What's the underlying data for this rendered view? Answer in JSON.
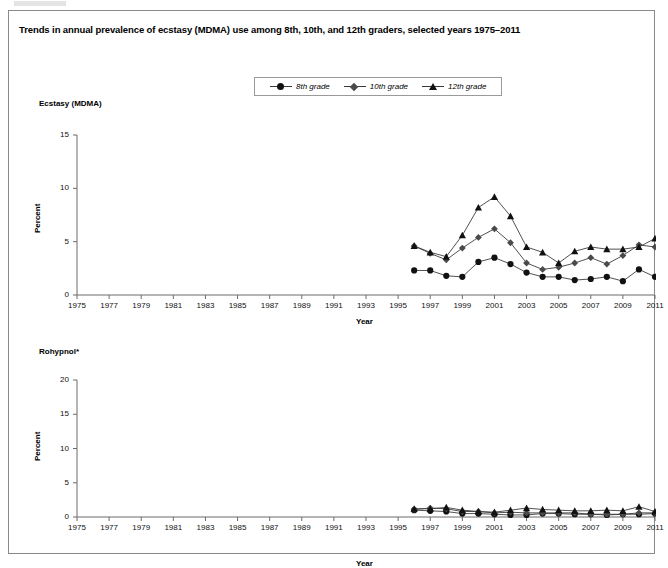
{
  "figure": {
    "title": "Trends in annual prevalence of ecstasy (MDMA) use among 8th, 10th, and 12th graders, selected years 1975–2011"
  },
  "legend": {
    "position": "top-center",
    "entries": [
      {
        "label": "8th grade",
        "marker": "circle",
        "color": "#111111"
      },
      {
        "label": "10th grade",
        "marker": "diamond",
        "color": "#4a4a4a"
      },
      {
        "label": "12th grade",
        "marker": "triangle",
        "color": "#111111"
      }
    ]
  },
  "panels": {
    "ecstasy": {
      "title": "Ecstasy (MDMA)",
      "ylabel": "Percent",
      "xlabel": "Year",
      "ytick_labels": [
        "15",
        "10",
        "5",
        "0"
      ],
      "xtick_labels": [
        "1975",
        "1977",
        "1979",
        "1981",
        "1983",
        "1985",
        "1987",
        "1989",
        "1991",
        "1993",
        "1995",
        "1997",
        "1999",
        "2001",
        "2003",
        "2005",
        "2007",
        "2009",
        "2011"
      ]
    },
    "rohypnol": {
      "title": "Rohypnol*",
      "ylabel": "Percent",
      "xlabel": "Year",
      "ytick_labels": [
        "20",
        "15",
        "10",
        "5",
        "0"
      ],
      "xtick_labels": [
        "1975",
        "1977",
        "1979",
        "1981",
        "1983",
        "1985",
        "1987",
        "1989",
        "1991",
        "1993",
        "1995",
        "1997",
        "1999",
        "2001",
        "2003",
        "2005",
        "2007",
        "2009",
        "2011"
      ]
    }
  },
  "chart_data": [
    {
      "type": "line",
      "id": "ecstasy-mdma",
      "title": "Ecstasy (MDMA)",
      "xlabel": "Year",
      "ylabel": "Percent",
      "xlim": [
        1975,
        2011
      ],
      "ylim": [
        0,
        15
      ],
      "yticks": [
        0,
        5,
        10,
        15
      ],
      "xticks": [
        1975,
        1977,
        1979,
        1981,
        1983,
        1985,
        1987,
        1989,
        1991,
        1993,
        1995,
        1997,
        1999,
        2001,
        2003,
        2005,
        2007,
        2009,
        2011
      ],
      "grid": false,
      "legend_position": "top-center",
      "x": [
        1996,
        1997,
        1998,
        1999,
        2000,
        2001,
        2002,
        2003,
        2004,
        2005,
        2006,
        2007,
        2008,
        2009,
        2010,
        2011
      ],
      "series": [
        {
          "name": "8th grade",
          "marker": "circle",
          "color": "#111111",
          "values": [
            2.3,
            2.3,
            1.8,
            1.7,
            3.1,
            3.5,
            2.9,
            2.1,
            1.7,
            1.7,
            1.4,
            1.5,
            1.7,
            1.3,
            2.4,
            1.7
          ]
        },
        {
          "name": "10th grade",
          "marker": "diamond",
          "color": "#4a4a4a",
          "values": [
            4.6,
            3.9,
            3.3,
            4.4,
            5.4,
            6.2,
            4.9,
            3.0,
            2.4,
            2.6,
            3.0,
            3.5,
            2.9,
            3.7,
            4.7,
            4.5
          ]
        },
        {
          "name": "12th grade",
          "marker": "triangle",
          "color": "#111111",
          "values": [
            4.6,
            4.0,
            3.6,
            5.6,
            8.2,
            9.2,
            7.4,
            4.5,
            4.0,
            3.0,
            4.1,
            4.5,
            4.3,
            4.3,
            4.5,
            5.3
          ]
        }
      ]
    },
    {
      "type": "line",
      "id": "rohypnol",
      "title": "Rohypnol*",
      "xlabel": "Year",
      "ylabel": "Percent",
      "xlim": [
        1975,
        2011
      ],
      "ylim": [
        0,
        20
      ],
      "yticks": [
        0,
        5,
        10,
        15,
        20
      ],
      "xticks": [
        1975,
        1977,
        1979,
        1981,
        1983,
        1985,
        1987,
        1989,
        1991,
        1993,
        1995,
        1997,
        1999,
        2001,
        2003,
        2005,
        2007,
        2009,
        2011
      ],
      "grid": false,
      "legend_position": "top-center",
      "x": [
        1996,
        1997,
        1998,
        1999,
        2000,
        2001,
        2002,
        2003,
        2004,
        2005,
        2006,
        2007,
        2008,
        2009,
        2010,
        2011
      ],
      "series": [
        {
          "name": "8th grade",
          "marker": "circle",
          "color": "#111111",
          "values": [
            1.0,
            0.9,
            0.8,
            0.5,
            0.5,
            0.4,
            0.3,
            0.3,
            0.5,
            0.5,
            0.4,
            0.4,
            0.3,
            0.4,
            0.4,
            0.5
          ]
        },
        {
          "name": "10th grade",
          "marker": "diamond",
          "color": "#4a4a4a",
          "values": [
            1.1,
            1.3,
            1.2,
            0.8,
            0.8,
            0.6,
            0.7,
            0.6,
            0.6,
            0.6,
            0.6,
            0.4,
            0.4,
            0.4,
            0.6,
            0.6
          ]
        },
        {
          "name": "12th grade",
          "marker": "triangle",
          "color": "#111111",
          "values": [
            1.2,
            1.2,
            1.4,
            1.0,
            0.8,
            0.7,
            1.0,
            1.3,
            1.1,
            1.0,
            0.9,
            0.9,
            1.0,
            0.9,
            1.5,
            0.8
          ]
        }
      ]
    }
  ]
}
